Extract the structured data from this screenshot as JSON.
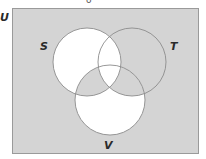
{
  "diagram": {
    "type": "venn",
    "universal_set_label": "U",
    "top_partial_glyph": "o",
    "sets": [
      {
        "id": "S",
        "label": "S",
        "cx": 87,
        "cy": 62,
        "r": 34
      },
      {
        "id": "T",
        "label": "T",
        "cx": 132,
        "cy": 62,
        "r": 34
      },
      {
        "id": "V",
        "label": "V",
        "cx": 110,
        "cy": 100,
        "r": 35
      }
    ],
    "shading": {
      "outside_all": "shaded",
      "S_only": "unshaded",
      "T_only": "shaded",
      "V_only": "unshaded",
      "S_and_T_not_V": "unshaded",
      "S_and_V_not_T": "shaded",
      "T_and_V_not_S": "shaded",
      "S_and_T_and_V": "unshaded"
    },
    "colors": {
      "shaded": "#d4d4d4",
      "unshaded": "#ffffff",
      "circle_stroke": "#8c8c8c",
      "frame_stroke": "#9a9a9a",
      "label": "#2a2a2a"
    }
  }
}
